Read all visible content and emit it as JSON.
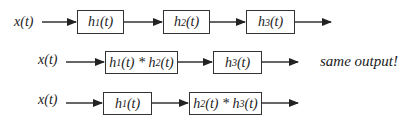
{
  "diagram": {
    "rows": [
      {
        "input": "x(t)",
        "blocks": [
          "h1(t)",
          "h2(t)",
          "h3(t)"
        ]
      },
      {
        "input": "x(t)",
        "blocks": [
          "h1(t) * h2(t)",
          "h3(t)"
        ],
        "note": "same output!"
      },
      {
        "input": "x(t)",
        "blocks": [
          "h1(t)",
          "h2(t) * h3(t)"
        ]
      }
    ]
  }
}
